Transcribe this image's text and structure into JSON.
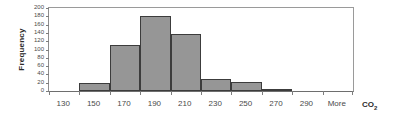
{
  "chart_data": {
    "type": "bar",
    "title": "",
    "subtitle": "",
    "xlabel": "CO",
    "xlabel_sub": "2",
    "ylabel": "Frequency",
    "categories": [
      "130",
      "150",
      "170",
      "190",
      "210",
      "230",
      "250",
      "270",
      "290",
      "More"
    ],
    "bin_edges": [
      130,
      150,
      170,
      190,
      210,
      230,
      250,
      270,
      290
    ],
    "values": [
      0,
      20,
      110,
      180,
      138,
      28,
      21,
      2,
      0,
      0
    ],
    "yticks": [
      0,
      20,
      40,
      60,
      80,
      100,
      120,
      140,
      160,
      180,
      200
    ],
    "ylim": [
      0,
      200
    ],
    "xtick_labels": [
      "130",
      "150",
      "170",
      "190",
      "210",
      "230",
      "250",
      "270",
      "290",
      "More"
    ],
    "grid": false,
    "legend": false,
    "legend_position": "none",
    "bar_color": "#969696",
    "bar_border_color": "#3c3c3c",
    "axis_color": "#7d7d7d",
    "background_color": "#ffffff",
    "text_color": "#4a4a4a"
  }
}
